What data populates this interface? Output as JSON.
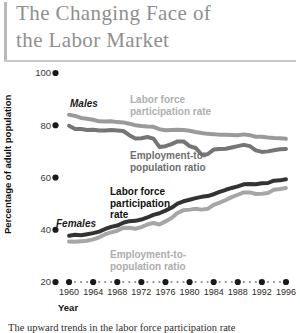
{
  "title": "The Changing Face of\nthe Labor Market",
  "caption": "The upward trends in the labor force participation rate",
  "axis": {
    "ylabel": "Percentage of adult population",
    "xlabel": "Year"
  },
  "colors": {
    "males_lfp": "#9a9a9a",
    "males_epr": "#757575",
    "females_lfp": "#333333",
    "females_epr": "#a6a6a6",
    "title": "#8f8f8f",
    "rule": "#b9b9b9",
    "axis_text": "#2b2b2b"
  },
  "annotations": {
    "males_group": "Males",
    "females_group": "Females",
    "males_lfp_label": "Labor force\nparticipation rate",
    "males_epr_label": "Employment-to-\npopulation ratio",
    "females_lfp_label": "Labor force\nparticipation\nrate",
    "females_epr_label": "Employment-to-\npopulation ratio"
  },
  "chart_data": {
    "type": "line",
    "title": "The Changing Face of the Labor Market",
    "xlabel": "Year",
    "ylabel": "Percentage of adult population",
    "xlim": [
      1958,
      1997
    ],
    "ylim": [
      20,
      100
    ],
    "ytick_values": [
      20,
      40,
      60,
      80,
      100
    ],
    "ytick_labels": [
      "20",
      "40",
      "60",
      "80",
      "100"
    ],
    "xtick_labels": [
      "1960",
      "1964",
      "1968",
      "1972",
      "1976",
      "1980",
      "1984",
      "1988",
      "1992",
      "1996"
    ],
    "xtick_values": [
      1960,
      1964,
      1968,
      1972,
      1976,
      1980,
      1984,
      1988,
      1992,
      1996
    ],
    "grid": false,
    "legend": "inline-annotations",
    "x": [
      1960,
      1961,
      1962,
      1963,
      1964,
      1965,
      1966,
      1967,
      1968,
      1969,
      1970,
      1971,
      1972,
      1973,
      1974,
      1975,
      1976,
      1977,
      1978,
      1979,
      1980,
      1981,
      1982,
      1983,
      1984,
      1985,
      1986,
      1987,
      1988,
      1989,
      1990,
      1991,
      1992,
      1993,
      1994,
      1995,
      1996
    ],
    "series": [
      {
        "name": "Males labor force participation rate",
        "group": "Males",
        "color": "#9a9a9a",
        "values": [
          84.0,
          83.6,
          82.8,
          82.5,
          82.1,
          81.5,
          81.4,
          81.5,
          81.2,
          81.1,
          80.6,
          80.0,
          79.7,
          79.5,
          79.4,
          78.5,
          78.1,
          78.2,
          78.3,
          78.2,
          77.9,
          77.4,
          77.0,
          76.7,
          76.6,
          76.4,
          76.4,
          76.3,
          76.2,
          76.5,
          76.2,
          75.6,
          75.6,
          75.3,
          75.1,
          75.0,
          74.8
        ]
      },
      {
        "name": "Males employment-to-population ratio",
        "group": "Males",
        "color": "#757575",
        "values": [
          79.8,
          78.6,
          78.6,
          78.2,
          78.3,
          78.0,
          78.0,
          78.2,
          78.0,
          77.8,
          76.2,
          74.9,
          75.0,
          75.5,
          74.9,
          71.7,
          72.0,
          72.8,
          73.8,
          73.8,
          72.0,
          71.3,
          68.8,
          68.9,
          70.7,
          70.9,
          71.0,
          71.5,
          72.0,
          72.5,
          72.0,
          70.4,
          69.8,
          70.0,
          70.4,
          70.8,
          70.9
        ]
      },
      {
        "name": "Females labor force participation rate",
        "group": "Females",
        "color": "#333333",
        "values": [
          37.7,
          38.1,
          37.9,
          38.3,
          38.7,
          39.3,
          40.3,
          41.1,
          41.6,
          42.7,
          43.3,
          43.4,
          43.9,
          44.7,
          45.7,
          46.3,
          47.3,
          48.4,
          50.0,
          50.9,
          51.5,
          52.1,
          52.6,
          52.9,
          53.6,
          54.5,
          55.3,
          56.0,
          56.6,
          57.4,
          57.5,
          57.4,
          57.8,
          57.9,
          58.8,
          58.9,
          59.3
        ]
      },
      {
        "name": "Females employment-to-population ratio",
        "group": "Females",
        "color": "#a6a6a6",
        "values": [
          35.5,
          35.4,
          35.6,
          35.8,
          36.3,
          37.1,
          38.3,
          39.0,
          39.6,
          40.7,
          40.8,
          40.4,
          41.0,
          42.0,
          42.6,
          42.0,
          43.2,
          44.5,
          46.4,
          47.5,
          47.7,
          48.0,
          47.7,
          48.0,
          49.5,
          50.4,
          51.4,
          52.5,
          53.4,
          54.3,
          54.3,
          53.7,
          53.8,
          54.1,
          55.3,
          55.6,
          56.0
        ]
      }
    ]
  }
}
